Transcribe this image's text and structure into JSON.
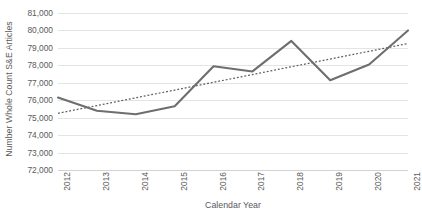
{
  "chart_data": {
    "type": "line",
    "title": "",
    "xlabel": "Calendar Year",
    "ylabel": "Number Whole Count S&E Articles",
    "categories": [
      "2012",
      "2013",
      "2014",
      "2015",
      "2016",
      "2017",
      "2018",
      "2019",
      "2020",
      "2021"
    ],
    "x": [
      2012,
      2013,
      2014,
      2015,
      2016,
      2017,
      2018,
      2019,
      2020,
      2021
    ],
    "series": [
      {
        "name": "Number Whole Count S&E Articles",
        "style": "solid",
        "color": "#6e6e6e",
        "values": [
          76150,
          75400,
          75200,
          75650,
          77950,
          77650,
          79400,
          77150,
          78050,
          80000
        ]
      },
      {
        "name": "Linear trendline",
        "style": "dotted",
        "color": "#5f5f5f",
        "values": [
          75250,
          75694,
          76139,
          76583,
          77028,
          77472,
          77917,
          78361,
          78806,
          79250
        ]
      }
    ],
    "ylim": [
      72000,
      81000
    ],
    "ytick_step": 1000,
    "ytick_labels": [
      "81,000",
      "80,000",
      "79,000",
      "78,000",
      "77,000",
      "76,000",
      "75,000",
      "74,000",
      "73,000",
      "72,000"
    ],
    "ytick_values": [
      81000,
      80000,
      79000,
      78000,
      77000,
      76000,
      75000,
      74000,
      73000,
      72000
    ],
    "grid": true,
    "grid_axis": "y",
    "legend": false,
    "legend_position": "none",
    "annotations": []
  }
}
